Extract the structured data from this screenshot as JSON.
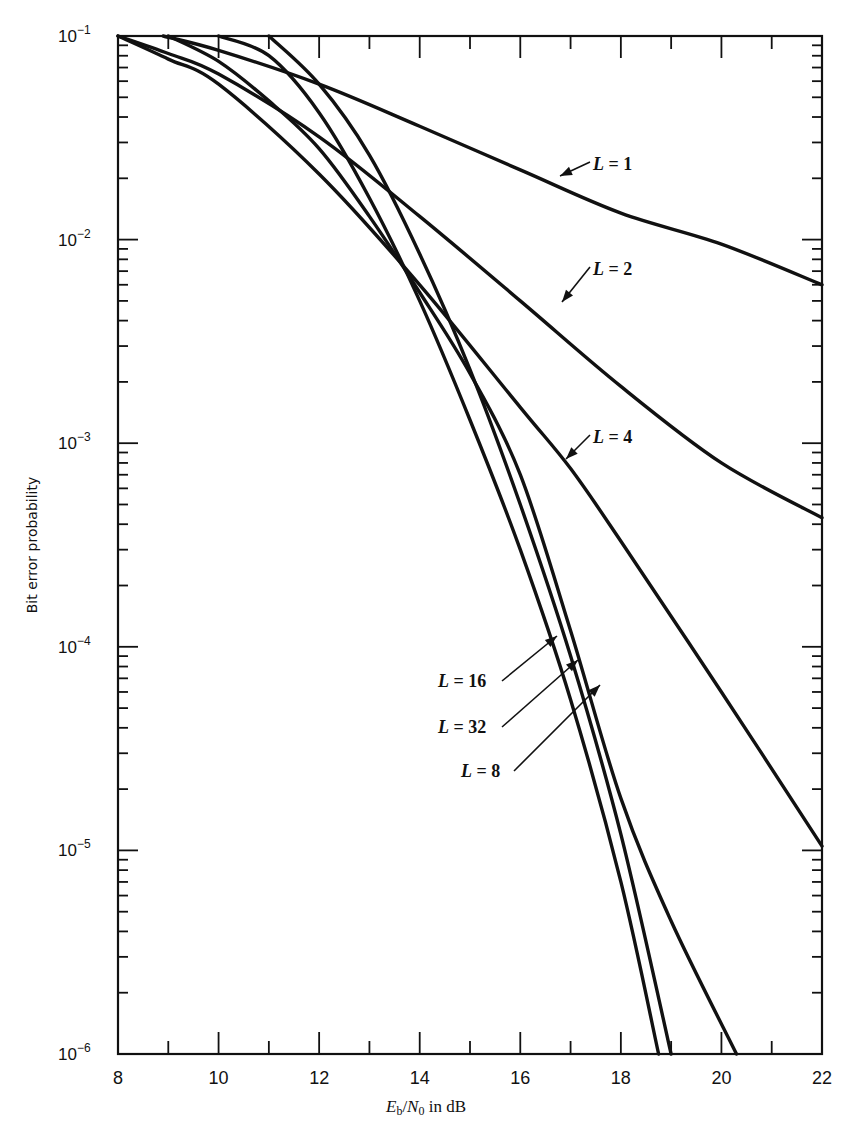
{
  "chart_data": {
    "type": "line",
    "title": "",
    "xlabel": "Eb/N0 in dB",
    "xlabel_parts": {
      "E": "E",
      "b": "b",
      "slash": "/",
      "N": "N",
      "zero": "0",
      "rest": " in dB"
    },
    "ylabel": "Bit error probability",
    "xscale": "linear",
    "yscale": "log",
    "xlim": [
      8,
      22
    ],
    "ylim": [
      1e-06,
      0.1
    ],
    "x_ticks": [
      8,
      10,
      12,
      14,
      16,
      18,
      20,
      22
    ],
    "x_tick_labels": [
      "8",
      "10",
      "12",
      "14",
      "16",
      "18",
      "20",
      "22"
    ],
    "y_ticks": [
      0.1,
      0.01,
      0.001,
      0.0001,
      1e-05,
      1e-06
    ],
    "y_tick_labels": [
      {
        "base": "10",
        "exp": "−1"
      },
      {
        "base": "10",
        "exp": "−2"
      },
      {
        "base": "10",
        "exp": "−3"
      },
      {
        "base": "10",
        "exp": "−4"
      },
      {
        "base": "10",
        "exp": "−5"
      },
      {
        "base": "10",
        "exp": "−6"
      }
    ],
    "grid": false,
    "legend": "inline labels with arrows",
    "series": [
      {
        "name": "L = 1",
        "L": "1",
        "x": [
          8.9,
          10,
          12,
          14,
          16,
          18,
          20,
          22
        ],
        "y": [
          0.1,
          0.085,
          0.058,
          0.036,
          0.022,
          0.0135,
          0.0095,
          0.006
        ],
        "label_pos": {
          "x": 593,
          "y": 170
        },
        "arrow_to": {
          "x": 560,
          "y": 176
        }
      },
      {
        "name": "L = 2",
        "L": "2",
        "x": [
          8,
          9,
          10,
          12,
          14,
          16,
          18,
          20,
          22
        ],
        "y": [
          0.1,
          0.082,
          0.065,
          0.032,
          0.013,
          0.005,
          0.0019,
          0.0008,
          0.00043
        ],
        "label_pos": {
          "x": 593,
          "y": 275
        },
        "arrow_to": {
          "x": 562,
          "y": 302
        }
      },
      {
        "name": "L = 4",
        "L": "4",
        "x": [
          8,
          9,
          10,
          12,
          14,
          16,
          17,
          18,
          20,
          22
        ],
        "y": [
          0.1,
          0.077,
          0.058,
          0.021,
          0.006,
          0.0015,
          0.00075,
          0.00033,
          6e-05,
          1.05e-05
        ],
        "label_pos": {
          "x": 593,
          "y": 443
        },
        "arrow_to": {
          "x": 566,
          "y": 459
        }
      },
      {
        "name": "L = 8",
        "L": "8",
        "x": [
          9,
          10,
          11,
          12,
          13,
          14,
          15,
          16,
          17,
          18,
          19,
          20.3
        ],
        "y": [
          0.1,
          0.075,
          0.048,
          0.028,
          0.013,
          0.0055,
          0.0022,
          0.0007,
          0.00012,
          1.8e-05,
          4.5e-06,
          1e-06
        ],
        "label_pos": {
          "x": 461,
          "y": 777
        },
        "arrow_to": {
          "x": 600,
          "y": 685
        }
      },
      {
        "name": "L = 16",
        "L": "16",
        "x": [
          10,
          11,
          12,
          13,
          14,
          15,
          16,
          17,
          18,
          18.75
        ],
        "y": [
          0.1,
          0.08,
          0.042,
          0.016,
          0.005,
          0.0013,
          0.0003,
          5.5e-05,
          7e-06,
          1e-06
        ],
        "label_pos": {
          "x": 438,
          "y": 687
        },
        "arrow_to": {
          "x": 557,
          "y": 636
        }
      },
      {
        "name": "L = 32",
        "L": "32",
        "x": [
          11,
          12,
          13,
          14,
          15,
          16,
          17,
          18,
          19
        ],
        "y": [
          0.1,
          0.058,
          0.026,
          0.0085,
          0.0023,
          0.0005,
          9e-05,
          1.2e-05,
          1e-06
        ],
        "label_pos": {
          "x": 438,
          "y": 733
        },
        "arrow_to": {
          "x": 578,
          "y": 660
        }
      }
    ],
    "annotations": [
      "L = 1",
      "L = 2",
      "L = 4",
      "L = 8",
      "L = 16",
      "L = 32"
    ]
  },
  "plot_area": {
    "left": 118,
    "right": 822,
    "top": 36,
    "bottom": 1054
  }
}
